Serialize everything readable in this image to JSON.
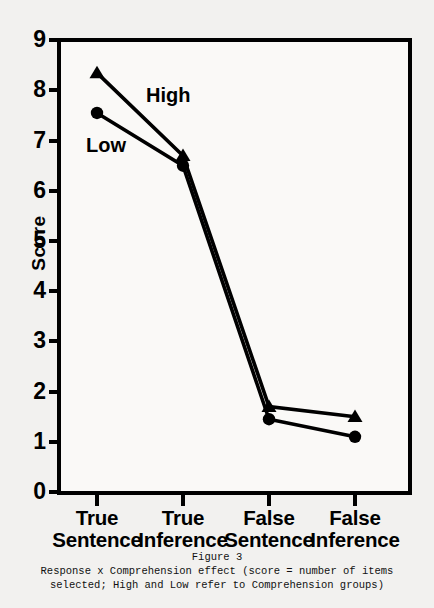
{
  "figure": {
    "caption_title": "Figure 3",
    "caption_line1": "Response x Comprehension effect (score = number of items",
    "caption_line2": "selected; High and Low refer to Comprehension groups)"
  },
  "chart_data": {
    "type": "line",
    "title": "",
    "xlabel": "",
    "ylabel": "Score",
    "ylim": [
      0,
      9
    ],
    "yticks": [
      0,
      1,
      2,
      3,
      4,
      5,
      6,
      7,
      8,
      9
    ],
    "ytick_labels": [
      "0",
      "1",
      "2",
      "3",
      "4",
      "5",
      "6",
      "7",
      "8",
      "9"
    ],
    "grid": false,
    "legend_position": "inline-annotation",
    "categories": [
      "True Sentence",
      "True Inference",
      "False Sentence",
      "False Inference"
    ],
    "category_lines": [
      {
        "line1": "True",
        "line2": "Sentence"
      },
      {
        "line1": "True",
        "line2": "Inference"
      },
      {
        "line1": "False",
        "line2": "Sentence"
      },
      {
        "line1": "False",
        "line2": "Inference"
      }
    ],
    "series": [
      {
        "name": "High",
        "marker": "triangle",
        "color": "#000000",
        "values": [
          8.35,
          6.7,
          1.7,
          1.5
        ]
      },
      {
        "name": "Low",
        "marker": "circle",
        "color": "#000000",
        "values": [
          7.55,
          6.5,
          1.45,
          1.1
        ]
      }
    ]
  }
}
